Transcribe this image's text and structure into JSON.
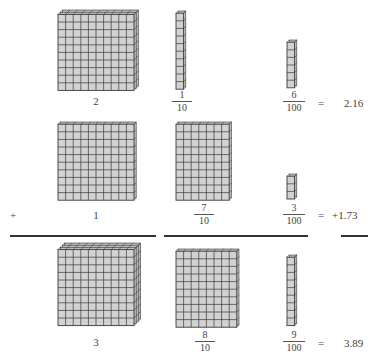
{
  "diagram": {
    "colors": {
      "cube_face": "#d2d2d2",
      "cube_side": "#bdbdbd",
      "grid_line": "#3a3a3a",
      "rule": "#333333"
    },
    "rows": [
      {
        "id": "addend-1",
        "operator": "",
        "ones": {
          "label": "2",
          "flats": 2
        },
        "tenths": {
          "numerator": "1",
          "denominator": "10",
          "rods": 1
        },
        "hundredths": {
          "numerator": "6",
          "denominator": "100",
          "cubes": 6
        },
        "equals": "=",
        "result": "2.16"
      },
      {
        "id": "addend-2",
        "operator": "+",
        "ones": {
          "label": "1",
          "flats": 1
        },
        "tenths": {
          "numerator": "7",
          "denominator": "10",
          "rods": 7
        },
        "hundredths": {
          "numerator": "3",
          "denominator": "100",
          "cubes": 3
        },
        "equals": "=",
        "result": "+1.73"
      },
      {
        "id": "sum",
        "operator": "",
        "ones": {
          "label": "3",
          "flats": 3
        },
        "tenths": {
          "numerator": "8",
          "denominator": "10",
          "rods": 8
        },
        "hundredths": {
          "numerator": "9",
          "denominator": "100",
          "cubes": 9
        },
        "equals": "=",
        "result": "3.89"
      }
    ]
  }
}
